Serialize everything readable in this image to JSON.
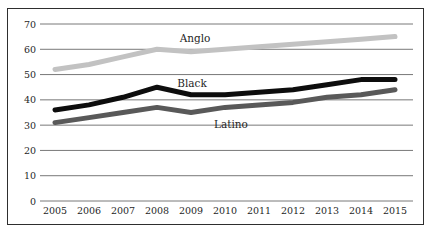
{
  "chart_data": {
    "type": "line",
    "title": "",
    "xlabel": "",
    "ylabel": "",
    "categories": [
      "2005",
      "2006",
      "2007",
      "2008",
      "2009",
      "2010",
      "2011",
      "2012",
      "2013",
      "2014",
      "2015"
    ],
    "series": [
      {
        "name": "Anglo",
        "color": "#c2c2c2",
        "values": [
          52,
          54,
          57,
          60,
          59,
          60,
          61,
          62,
          63,
          64,
          65
        ]
      },
      {
        "name": "Black",
        "color": "#0d0d0d",
        "values": [
          36,
          38,
          41,
          45,
          42,
          42,
          43,
          44,
          46,
          48,
          48
        ]
      },
      {
        "name": "Latino",
        "color": "#595959",
        "values": [
          31,
          33,
          35,
          37,
          35,
          37,
          38,
          39,
          41,
          42,
          44
        ]
      }
    ],
    "ylim": [
      0,
      70
    ],
    "yticks": [
      0,
      10,
      20,
      30,
      40,
      50,
      60,
      70
    ],
    "grid": "horizontal",
    "legend": "inline-labels",
    "series_labels": [
      {
        "text": "Anglo",
        "x": 195,
        "y": 42
      },
      {
        "text": "Black",
        "x": 192,
        "y": 87
      },
      {
        "text": "Latino",
        "x": 231,
        "y": 128
      }
    ]
  },
  "frame": {
    "background": "#ffffff",
    "border_color": "#2e2e2e",
    "grid_color": "#787878",
    "text_color": "#1f1f1f"
  }
}
